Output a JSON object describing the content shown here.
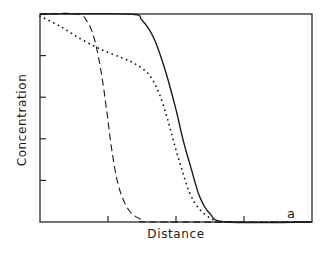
{
  "chart_data": {
    "type": "line",
    "title": "",
    "xlabel": "Distance",
    "ylabel": "Concentration",
    "panel_label": "a",
    "xlim": [
      0,
      4
    ],
    "ylim": [
      0,
      5
    ],
    "x_ticks": [
      1,
      2,
      3
    ],
    "y_ticks": [
      1,
      2,
      3,
      4
    ],
    "tick_labels_shown": false,
    "grid": false,
    "legend": null,
    "series": [
      {
        "name": "solid",
        "style": "solid",
        "points": [
          [
            0,
            5.0
          ],
          [
            1.3,
            5.0
          ],
          [
            1.5,
            4.85
          ],
          [
            1.68,
            4.4
          ],
          [
            1.85,
            3.6
          ],
          [
            2.0,
            2.7
          ],
          [
            2.1,
            2.0
          ],
          [
            2.22,
            1.3
          ],
          [
            2.35,
            0.6
          ],
          [
            2.5,
            0.2
          ],
          [
            2.75,
            0.0
          ],
          [
            4.0,
            0.0
          ]
        ]
      },
      {
        "name": "dashed",
        "style": "dashed",
        "points": [
          [
            0,
            5.0
          ],
          [
            0.55,
            5.0
          ],
          [
            0.7,
            4.8
          ],
          [
            0.8,
            4.4
          ],
          [
            0.9,
            3.6
          ],
          [
            0.98,
            2.7
          ],
          [
            1.05,
            1.8
          ],
          [
            1.15,
            0.9
          ],
          [
            1.3,
            0.3
          ],
          [
            1.5,
            0.05
          ],
          [
            1.7,
            0.0
          ],
          [
            4.0,
            0.0
          ]
        ]
      },
      {
        "name": "dotted",
        "style": "dotted",
        "points": [
          [
            0,
            4.95
          ],
          [
            0.3,
            4.7
          ],
          [
            0.6,
            4.4
          ],
          [
            0.9,
            4.15
          ],
          [
            1.2,
            3.95
          ],
          [
            1.4,
            3.8
          ],
          [
            1.6,
            3.55
          ],
          [
            1.75,
            3.1
          ],
          [
            1.87,
            2.5
          ],
          [
            1.97,
            1.9
          ],
          [
            2.08,
            1.3
          ],
          [
            2.2,
            0.7
          ],
          [
            2.35,
            0.3
          ],
          [
            2.55,
            0.05
          ],
          [
            2.7,
            0.0
          ],
          [
            4.0,
            0.0
          ]
        ]
      }
    ]
  }
}
